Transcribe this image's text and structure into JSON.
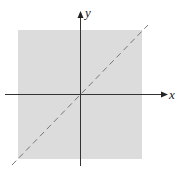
{
  "diagram": {
    "axes": {
      "x_label": "x",
      "y_label": "y"
    },
    "region": {
      "fill": "#dcdcdc",
      "description": "shaded square region"
    },
    "line": {
      "style": "dashed",
      "equation": "y = x",
      "color": "#777777"
    },
    "colors": {
      "axis": "#333333",
      "background": "#ffffff"
    }
  }
}
